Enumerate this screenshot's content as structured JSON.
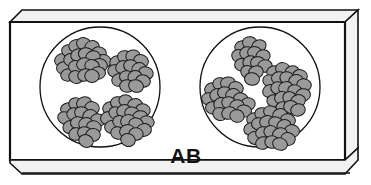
{
  "figure": {
    "title": "AB",
    "kind": "blood-typing-slide",
    "label_text": "AB",
    "label_x": 186,
    "label_y": 163,
    "background_color": "#ffffff",
    "outline_color": "#111111",
    "cell_fill_color": "#9a9a9a",
    "cell_outline_color": "#1a1a1a",
    "slide_edge_color": "#f2f2f2"
  },
  "slide": {
    "name": "glass-slide",
    "body_points": "10,22 345,22 345,160 10,160",
    "top_edge_points": "10,22 22,10 358,10 345,22",
    "right_edge_points": "345,22 358,10 358,148 345,160",
    "bottom_strip_points": "10,160 345,160 358,148 358,160 345,174 22,174 10,163",
    "bottom_rule_y1": 166,
    "bottom_rule_y2": 174
  },
  "wells": [
    {
      "name": "well-left",
      "label": "Anti-A reagent well",
      "cx": 100,
      "cy": 87,
      "r": 60,
      "agglutination": true,
      "cluster_count": 4,
      "clusters": [
        {
          "name": "cluster-left-top-left",
          "cx": 84,
          "cy": 62,
          "cell_count": 21,
          "cells": [
            [
              -22,
              -2,
              7.5,
              6.3,
              -18
            ],
            [
              -15,
              -11,
              7.4,
              6.2,
              12
            ],
            [
              -8,
              -16,
              7.2,
              6.4,
              -8
            ],
            [
              0,
              -18,
              7.6,
              6.2,
              20
            ],
            [
              8,
              -15,
              7.3,
              6.3,
              -14
            ],
            [
              15,
              -9,
              7.4,
              6.1,
              8
            ],
            [
              20,
              -1,
              7.2,
              6.4,
              24
            ],
            [
              -20,
              6,
              7.5,
              6.2,
              -6
            ],
            [
              -13,
              -2,
              7.3,
              6.4,
              16
            ],
            [
              -6,
              -7,
              7.4,
              6.1,
              -20
            ],
            [
              2,
              -8,
              7.6,
              6.3,
              6
            ],
            [
              9,
              -5,
              7.2,
              6.2,
              -12
            ],
            [
              16,
              3,
              7.4,
              6.4,
              18
            ],
            [
              -16,
              13,
              7.3,
              6.1,
              -10
            ],
            [
              -8,
              5,
              7.5,
              6.3,
              14
            ],
            [
              0,
              2,
              7.4,
              6.2,
              -16
            ],
            [
              8,
              4,
              7.2,
              6.4,
              10
            ],
            [
              14,
              11,
              7.5,
              6.2,
              -4
            ],
            [
              -8,
              15,
              7.3,
              6.3,
              22
            ],
            [
              1,
              13,
              7.4,
              6.1,
              -18
            ],
            [
              8,
              14,
              7.2,
              6.4,
              4
            ]
          ]
        },
        {
          "name": "cluster-left-top-right",
          "cx": 131,
          "cy": 70,
          "cell_count": 15,
          "cells": [
            [
              -14,
              -8,
              7.3,
              6.2,
              -14
            ],
            [
              -6,
              -13,
              7.5,
              6.3,
              10
            ],
            [
              2,
              -14,
              7.2,
              6.1,
              -6
            ],
            [
              10,
              -9,
              7.4,
              6.4,
              18
            ],
            [
              -16,
              1,
              7.3,
              6.2,
              6
            ],
            [
              -8,
              -3,
              7.5,
              6.3,
              -20
            ],
            [
              0,
              -4,
              7.4,
              6.1,
              14
            ],
            [
              8,
              -1,
              7.2,
              6.4,
              -8
            ],
            [
              15,
              3,
              7.4,
              6.2,
              20
            ],
            [
              -12,
              10,
              7.3,
              6.3,
              -12
            ],
            [
              -4,
              7,
              7.5,
              6.2,
              8
            ],
            [
              4,
              7,
              7.2,
              6.4,
              -16
            ],
            [
              12,
              11,
              7.4,
              6.1,
              12
            ],
            [
              -4,
              16,
              7.3,
              6.3,
              -2
            ],
            [
              5,
              16,
              7.5,
              6.2,
              16
            ]
          ]
        },
        {
          "name": "cluster-left-bottom-left",
          "cx": 84,
          "cy": 118,
          "cell_count": 17,
          "cells": [
            [
              -16,
              -9,
              7.4,
              6.2,
              -10
            ],
            [
              -8,
              -14,
              7.2,
              6.3,
              14
            ],
            [
              0,
              -15,
              7.5,
              6.1,
              -18
            ],
            [
              8,
              -10,
              7.3,
              6.4,
              8
            ],
            [
              -19,
              0,
              7.4,
              6.2,
              20
            ],
            [
              -10,
              -4,
              7.2,
              6.3,
              -6
            ],
            [
              -2,
              -5,
              7.5,
              6.2,
              16
            ],
            [
              6,
              -2,
              7.3,
              6.4,
              -14
            ],
            [
              14,
              2,
              7.4,
              6.1,
              10
            ],
            [
              -14,
              9,
              7.2,
              6.3,
              -20
            ],
            [
              -6,
              5,
              7.5,
              6.2,
              6
            ],
            [
              2,
              6,
              7.3,
              6.4,
              -8
            ],
            [
              10,
              9,
              7.4,
              6.2,
              18
            ],
            [
              -8,
              16,
              7.2,
              6.3,
              -12
            ],
            [
              1,
              15,
              7.5,
              6.1,
              12
            ],
            [
              9,
              17,
              7.3,
              6.4,
              -4
            ],
            [
              2,
              23,
              7.4,
              6.2,
              22
            ]
          ]
        },
        {
          "name": "cluster-left-bottom-right",
          "cx": 128,
          "cy": 118,
          "cell_count": 20,
          "cells": [
            [
              -18,
              -10,
              7.3,
              6.2,
              -16
            ],
            [
              -10,
              -15,
              7.5,
              6.3,
              8
            ],
            [
              -2,
              -17,
              7.2,
              6.1,
              20
            ],
            [
              7,
              -13,
              7.4,
              6.4,
              -6
            ],
            [
              15,
              -8,
              7.3,
              6.2,
              14
            ],
            [
              -20,
              0,
              7.5,
              6.3,
              -12
            ],
            [
              -12,
              -5,
              7.2,
              6.2,
              18
            ],
            [
              -4,
              -7,
              7.4,
              6.4,
              -20
            ],
            [
              4,
              -5,
              7.3,
              6.1,
              6
            ],
            [
              12,
              -1,
              7.5,
              6.3,
              -10
            ],
            [
              19,
              4,
              7.2,
              6.2,
              16
            ],
            [
              -16,
              9,
              7.4,
              6.4,
              -4
            ],
            [
              -8,
              4,
              7.3,
              6.2,
              22
            ],
            [
              0,
              3,
              7.5,
              6.3,
              -14
            ],
            [
              8,
              6,
              7.2,
              6.1,
              10
            ],
            [
              16,
              12,
              7.4,
              6.4,
              -8
            ],
            [
              -10,
              15,
              7.3,
              6.2,
              12
            ],
            [
              -1,
              13,
              7.5,
              6.3,
              -18
            ],
            [
              8,
              16,
              7.2,
              6.2,
              4
            ],
            [
              0,
              22,
              7.4,
              6.4,
              20
            ]
          ]
        }
      ]
    },
    {
      "name": "well-right",
      "label": "Anti-B reagent well",
      "cx": 260,
      "cy": 87,
      "r": 60,
      "agglutination": true,
      "cluster_count": 4,
      "clusters": [
        {
          "name": "cluster-right-top-middle",
          "cx": 252,
          "cy": 57,
          "cell_count": 14,
          "cells": [
            [
              -10,
              -10,
              7.3,
              6.2,
              -12
            ],
            [
              -2,
              -14,
              7.5,
              6.3,
              10
            ],
            [
              7,
              -11,
              7.2,
              6.1,
              -18
            ],
            [
              -13,
              -1,
              7.4,
              6.4,
              16
            ],
            [
              -5,
              -4,
              7.3,
              6.2,
              -6
            ],
            [
              3,
              -4,
              7.5,
              6.3,
              20
            ],
            [
              11,
              -1,
              7.2,
              6.2,
              -14
            ],
            [
              -10,
              8,
              7.4,
              6.4,
              8
            ],
            [
              -2,
              5,
              7.3,
              6.1,
              -20
            ],
            [
              6,
              6,
              7.5,
              6.3,
              12
            ],
            [
              13,
              9,
              7.2,
              6.2,
              -4
            ],
            [
              -4,
              15,
              7.4,
              6.4,
              18
            ],
            [
              4,
              15,
              7.3,
              6.2,
              -10
            ],
            [
              0,
              22,
              7.5,
              6.3,
              6
            ]
          ]
        },
        {
          "name": "cluster-right-left",
          "cx": 228,
          "cy": 97,
          "cell_count": 18,
          "cells": [
            [
              -16,
              -8,
              7.4,
              6.2,
              -16
            ],
            [
              -8,
              -13,
              7.2,
              6.3,
              12
            ],
            [
              0,
              -14,
              7.5,
              6.1,
              -6
            ],
            [
              8,
              -9,
              7.3,
              6.4,
              18
            ],
            [
              -19,
              2,
              7.4,
              6.2,
              8
            ],
            [
              -11,
              -2,
              7.2,
              6.3,
              -20
            ],
            [
              -3,
              -4,
              7.5,
              6.2,
              14
            ],
            [
              5,
              -2,
              7.3,
              6.4,
              -10
            ],
            [
              13,
              2,
              7.4,
              6.1,
              20
            ],
            [
              20,
              7,
              7.2,
              6.3,
              -4
            ],
            [
              -15,
              11,
              7.5,
              6.2,
              10
            ],
            [
              -7,
              7,
              7.3,
              6.4,
              -14
            ],
            [
              1,
              6,
              7.4,
              6.2,
              16
            ],
            [
              9,
              9,
              7.2,
              6.3,
              -8
            ],
            [
              16,
              14,
              7.5,
              6.1,
              6
            ],
            [
              -8,
              17,
              7.3,
              6.4,
              22
            ],
            [
              1,
              16,
              7.4,
              6.2,
              -18
            ],
            [
              9,
              19,
              7.2,
              6.3,
              12
            ]
          ]
        },
        {
          "name": "cluster-right-right",
          "cx": 288,
          "cy": 90,
          "cell_count": 21,
          "cells": [
            [
              -14,
              -18,
              7.3,
              6.2,
              -10
            ],
            [
              -5,
              -21,
              7.5,
              6.3,
              14
            ],
            [
              4,
              -18,
              7.2,
              6.1,
              -18
            ],
            [
              12,
              -14,
              7.4,
              6.4,
              8
            ],
            [
              -18,
              -9,
              7.3,
              6.2,
              20
            ],
            [
              -9,
              -12,
              7.5,
              6.3,
              -6
            ],
            [
              -1,
              -12,
              7.2,
              6.2,
              16
            ],
            [
              8,
              -9,
              7.4,
              6.4,
              -14
            ],
            [
              16,
              -5,
              7.3,
              6.1,
              10
            ],
            [
              -18,
              1,
              7.5,
              6.3,
              -20
            ],
            [
              -10,
              -2,
              7.2,
              6.2,
              6
            ],
            [
              -2,
              -2,
              7.4,
              6.4,
              -8
            ],
            [
              7,
              1,
              7.3,
              6.2,
              18
            ],
            [
              15,
              5,
              7.5,
              6.3,
              -12
            ],
            [
              -14,
              11,
              7.2,
              6.1,
              12
            ],
            [
              -6,
              8,
              7.4,
              6.4,
              -4
            ],
            [
              2,
              8,
              7.3,
              6.2,
              22
            ],
            [
              10,
              11,
              7.5,
              6.3,
              -16
            ],
            [
              -5,
              18,
              7.2,
              6.2,
              4
            ],
            [
              3,
              17,
              7.4,
              6.4,
              20
            ],
            [
              10,
              20,
              7.3,
              6.1,
              -10
            ]
          ]
        },
        {
          "name": "cluster-right-bottom",
          "cx": 272,
          "cy": 127,
          "cell_count": 19,
          "cells": [
            [
              -18,
              -8,
              7.4,
              6.2,
              -14
            ],
            [
              -10,
              -13,
              7.2,
              6.3,
              10
            ],
            [
              -1,
              -15,
              7.5,
              6.1,
              20
            ],
            [
              8,
              -12,
              7.3,
              6.4,
              -6
            ],
            [
              16,
              -7,
              7.4,
              6.2,
              16
            ],
            [
              -21,
              2,
              7.2,
              6.3,
              -18
            ],
            [
              -13,
              -3,
              7.5,
              6.2,
              8
            ],
            [
              -5,
              -5,
              7.3,
              6.4,
              -10
            ],
            [
              4,
              -4,
              7.4,
              6.1,
              18
            ],
            [
              12,
              -1,
              7.2,
              6.3,
              -20
            ],
            [
              20,
              4,
              7.5,
              6.2,
              6
            ],
            [
              -17,
              11,
              7.3,
              6.4,
              14
            ],
            [
              -9,
              6,
              7.4,
              6.2,
              -8
            ],
            [
              -1,
              5,
              7.2,
              6.3,
              22
            ],
            [
              8,
              7,
              7.5,
              6.1,
              -12
            ],
            [
              16,
              12,
              7.3,
              6.4,
              10
            ],
            [
              -9,
              16,
              7.4,
              6.2,
              -16
            ],
            [
              0,
              15,
              7.2,
              6.3,
              4
            ],
            [
              8,
              17,
              7.5,
              6.2,
              18
            ]
          ]
        }
      ]
    }
  ]
}
